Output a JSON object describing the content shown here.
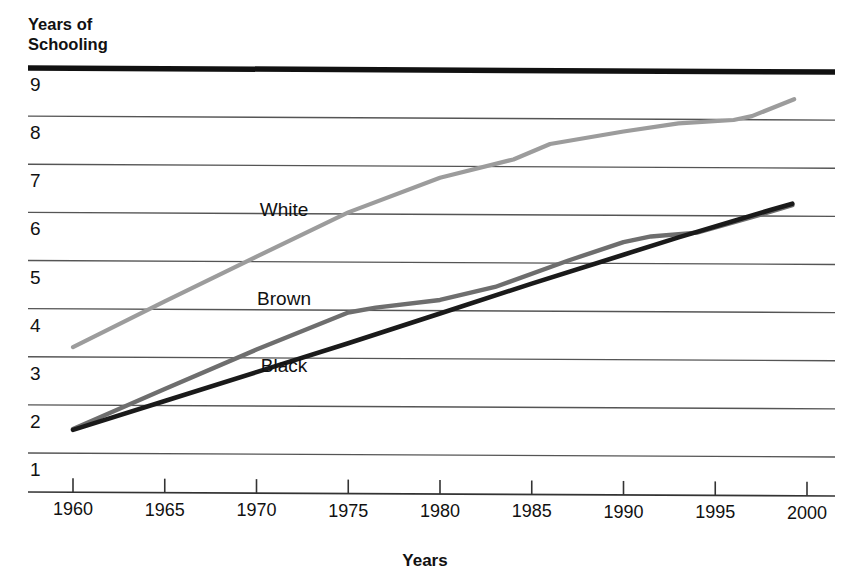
{
  "chart_data": {
    "type": "line",
    "title": "Years of Schooling",
    "title_line1": "Years of",
    "title_line2": "Schooling",
    "xlabel": "Years",
    "ylabel": "Years of Schooling",
    "xlim": [
      1958,
      2001
    ],
    "ylim": [
      0.4,
      9.3
    ],
    "xticks": [
      1960,
      1965,
      1970,
      1975,
      1980,
      1985,
      1990,
      1995,
      2000
    ],
    "xticklabels": [
      "1960",
      "1965",
      "1970",
      "1975",
      "1980",
      "1985",
      "1990",
      "1995",
      "2000"
    ],
    "yticks": [
      1,
      2,
      3,
      4,
      5,
      6,
      7,
      8,
      9
    ],
    "yticklabels": [
      "1",
      "2",
      "3",
      "4",
      "5",
      "6",
      "7",
      "8",
      "9"
    ],
    "grid": true,
    "grid_axis": "y",
    "legend": "inline-labels",
    "series": [
      {
        "name": "White",
        "color": "#9c9c9c",
        "stroke_width": 4.2,
        "label_x": 1971.5,
        "label_y": 5.92,
        "x": [
          1960,
          1965,
          1970,
          1975,
          1980,
          1984,
          1986,
          1990,
          1993,
          1996,
          1997,
          1999.3
        ],
        "y": [
          3.2,
          4.15,
          5.08,
          6.0,
          6.72,
          7.1,
          7.42,
          7.68,
          7.85,
          7.92,
          8.0,
          8.35
        ]
      },
      {
        "name": "Brown",
        "color": "#6e6e6e",
        "stroke_width": 4.4,
        "label_x": 1971.5,
        "label_y": 4.08,
        "x": [
          1960,
          1965,
          1970,
          1975,
          1976.5,
          1980,
          1983,
          1987,
          1990,
          1991.5,
          1994,
          1997,
          1999.2
        ],
        "y": [
          1.5,
          2.33,
          3.15,
          3.92,
          4.02,
          4.18,
          4.45,
          5.0,
          5.38,
          5.5,
          5.58,
          5.9,
          6.15
        ]
      },
      {
        "name": "Black",
        "color": "#1a1a1a",
        "stroke_width": 4.6,
        "label_x": 1971.5,
        "label_y": 2.68,
        "x": [
          1960,
          1965,
          1970,
          1975,
          1980,
          1985,
          1990,
          1993,
          1996,
          1998,
          1999.2
        ],
        "y": [
          1.48,
          2.08,
          2.68,
          3.28,
          3.9,
          4.52,
          5.12,
          5.48,
          5.82,
          6.05,
          6.18
        ]
      }
    ],
    "annotations": {
      "top_rule_label": "9",
      "top_rule_color": "#111111"
    },
    "colors": {
      "grid": "#555555",
      "axis": "#333333",
      "text": "#111111",
      "white_series": "#9c9c9c",
      "brown_series": "#6e6e6e",
      "black_series": "#1a1a1a"
    }
  }
}
